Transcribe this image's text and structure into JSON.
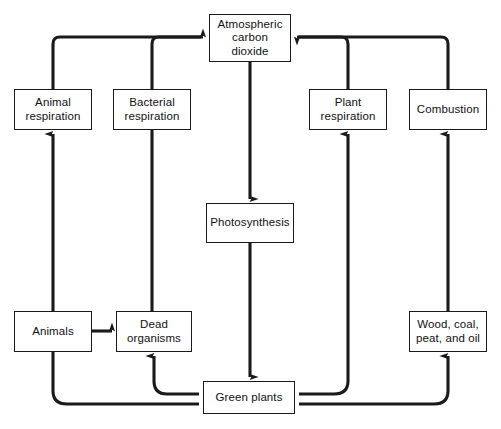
{
  "diagram": {
    "type": "flow-diagram",
    "background_color": "#ffffff",
    "line_color": "#1a1a1a",
    "box_border_color": "#1a1a1a",
    "nodes": [
      {
        "id": "atmospheric-carbon-dioxide",
        "label": "Atmospheric\ncarbon\ndioxide",
        "x": 209,
        "y": 14,
        "w": 82,
        "h": 48
      },
      {
        "id": "animal-respiration",
        "label": "Animal\nrespiration",
        "x": 14,
        "y": 89,
        "w": 78,
        "h": 41
      },
      {
        "id": "bacterial-respiration",
        "label": "Bacterial\nrespiration",
        "x": 113,
        "y": 89,
        "w": 78,
        "h": 41
      },
      {
        "id": "plant-respiration",
        "label": "Plant\nrespiration",
        "x": 309,
        "y": 89,
        "w": 78,
        "h": 41
      },
      {
        "id": "combustion",
        "label": "Combustion",
        "x": 409,
        "y": 89,
        "w": 78,
        "h": 41
      },
      {
        "id": "photosynthesis",
        "label": "Photosynthesis",
        "x": 206,
        "y": 203,
        "w": 88,
        "h": 40
      },
      {
        "id": "animals",
        "label": "Animals",
        "x": 14,
        "y": 311,
        "w": 78,
        "h": 41
      },
      {
        "id": "dead-organisms",
        "label": "Dead\norganisms",
        "x": 116,
        "y": 311,
        "w": 76,
        "h": 41
      },
      {
        "id": "wood-coal-peat-and-oil",
        "label": "Wood, coal,\npeat, and oil",
        "x": 409,
        "y": 311,
        "w": 78,
        "h": 41
      },
      {
        "id": "green-plants",
        "label": "Green plants",
        "x": 203,
        "y": 381,
        "w": 92,
        "h": 33
      }
    ],
    "edges": [
      {
        "id": "animal-respiration-to-atmosphere",
        "from": "animal-respiration",
        "to": "atmospheric-carbon-dioxide",
        "arrow": true
      },
      {
        "id": "bacterial-respiration-to-atmosphere",
        "from": "bacterial-respiration",
        "to": "atmospheric-carbon-dioxide",
        "arrow": true
      },
      {
        "id": "plant-respiration-to-atmosphere",
        "from": "plant-respiration",
        "to": "atmospheric-carbon-dioxide",
        "arrow": true
      },
      {
        "id": "combustion-to-atmosphere",
        "from": "combustion",
        "to": "atmospheric-carbon-dioxide",
        "arrow": true
      },
      {
        "id": "atmosphere-to-photosynthesis",
        "from": "atmospheric-carbon-dioxide",
        "to": "photosynthesis",
        "arrow": true
      },
      {
        "id": "photosynthesis-to-green-plants",
        "from": "photosynthesis",
        "to": "green-plants",
        "arrow": true
      },
      {
        "id": "animals-to-animal-respiration",
        "from": "animals",
        "to": "animal-respiration",
        "arrow": true
      },
      {
        "id": "animals-to-dead-organisms",
        "from": "animals",
        "to": "dead-organisms",
        "arrow": true
      },
      {
        "id": "dead-organisms-to-bacterial-respiration",
        "from": "dead-organisms",
        "to": "bacterial-respiration",
        "arrow": false
      },
      {
        "id": "green-plants-to-dead-organisms",
        "from": "green-plants",
        "to": "dead-organisms",
        "arrow": true
      },
      {
        "id": "green-plants-to-animals",
        "from": "green-plants",
        "to": "animals",
        "arrow": false
      },
      {
        "id": "green-plants-to-plant-respiration",
        "from": "green-plants",
        "to": "plant-respiration",
        "arrow": true
      },
      {
        "id": "green-plants-to-wood-coal-peat-and-oil",
        "from": "green-plants",
        "to": "wood-coal-peat-and-oil",
        "arrow": true
      },
      {
        "id": "wood-coal-peat-and-oil-to-combustion",
        "from": "wood-coal-peat-and-oil",
        "to": "combustion",
        "arrow": true
      }
    ]
  }
}
